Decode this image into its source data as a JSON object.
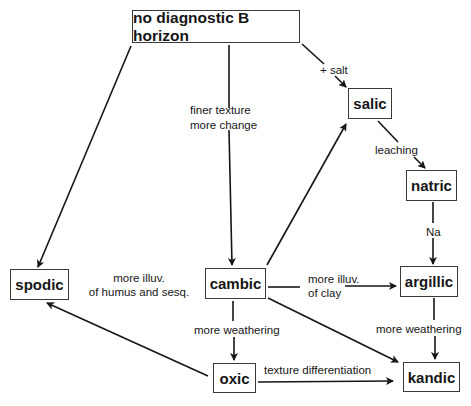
{
  "nodes": {
    "top": "no diagnostic B horizon",
    "salic": "salic",
    "natric": "natric",
    "spodic": "spodic",
    "cambic": "cambic",
    "argillic": "argillic",
    "oxic": "oxic",
    "kandic": "kandic"
  },
  "edge_labels": {
    "salt": "+ salt",
    "finer_texture_1": "finer texture",
    "finer_texture_2": "more change",
    "leaching": "leaching",
    "na": "Na",
    "illuv_humus_1": "more illuv.",
    "illuv_humus_2": "of humus and sesq.",
    "illuv_clay_1": "more illuv.",
    "illuv_clay_2": "of clay",
    "weathering_cambic": "more weathering",
    "weathering_argillic": "more weathering",
    "texture_diff": "texture differentiation"
  },
  "edges": [
    {
      "from": "top",
      "to": "spodic"
    },
    {
      "from": "top",
      "to": "cambic",
      "label": "finer texture / more change"
    },
    {
      "from": "top",
      "to": "salic",
      "label": "+ salt"
    },
    {
      "from": "salic",
      "to": "natric",
      "label": "leaching"
    },
    {
      "from": "natric",
      "to": "argillic",
      "label": "Na"
    },
    {
      "from": "cambic",
      "to": "salic"
    },
    {
      "from": "cambic",
      "to": "argillic",
      "label": "more illuv. of clay"
    },
    {
      "from": "cambic",
      "to": "oxic",
      "label": "more weathering"
    },
    {
      "from": "cambic",
      "to": "kandic"
    },
    {
      "from": "argillic",
      "to": "kandic",
      "label": "more weathering"
    },
    {
      "from": "oxic",
      "to": "kandic",
      "label": "texture differentiation"
    },
    {
      "from": "oxic",
      "to": "spodic"
    }
  ]
}
